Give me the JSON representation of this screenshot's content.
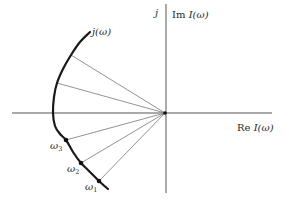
{
  "figure": {
    "type": "phasor-locus-diagram",
    "colors": {
      "background": "#ffffff",
      "axes": "#555555",
      "curve": "#1a1a1a",
      "rays": "#777777",
      "points": "#111111",
      "text": "#2a2a2a"
    },
    "axes": {
      "origin": [
        165,
        113
      ],
      "horizontal": {
        "x1": 12,
        "x2": 272,
        "y": 113,
        "label_prefix": "Re",
        "label_var": "I(ω)"
      },
      "vertical": {
        "x": 166,
        "y1": 4,
        "y2": 193,
        "label_prefix": "Im",
        "label_var": "I(ω)"
      },
      "imag_unit_label": "j"
    },
    "curve": {
      "label": "j(ω)",
      "points": [
        [
          90,
          32
        ],
        [
          80,
          42
        ],
        [
          71,
          55
        ],
        [
          63,
          69
        ],
        [
          57,
          83
        ],
        [
          54,
          97
        ],
        [
          53,
          113
        ],
        [
          55,
          126
        ],
        [
          60,
          134
        ],
        [
          66,
          140
        ],
        [
          73,
          152
        ],
        [
          81,
          163
        ],
        [
          90,
          172
        ],
        [
          99,
          181
        ],
        [
          108,
          189
        ]
      ]
    },
    "rays": [
      {
        "to": [
          71,
          55
        ]
      },
      {
        "to": [
          57,
          83
        ]
      },
      {
        "to": [
          66,
          140
        ]
      },
      {
        "to": [
          81,
          163
        ]
      },
      {
        "to": [
          99,
          181
        ]
      }
    ],
    "marked_points": [
      {
        "label": "ω",
        "sub": "3",
        "at": [
          66,
          140
        ]
      },
      {
        "label": "ω",
        "sub": "2",
        "at": [
          81,
          163
        ]
      },
      {
        "label": "ω",
        "sub": "1",
        "at": [
          99,
          181
        ]
      }
    ]
  }
}
